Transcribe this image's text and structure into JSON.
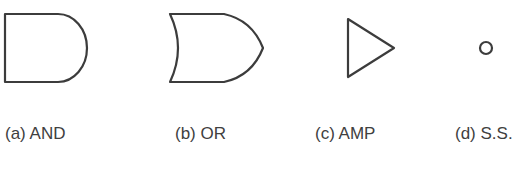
{
  "figure": {
    "symbols": [
      {
        "id": "a",
        "label": "(a) AND",
        "shape": "and-gate-icon"
      },
      {
        "id": "b",
        "label": "(b) OR",
        "shape": "or-gate-icon"
      },
      {
        "id": "c",
        "label": "(c) AMP",
        "shape": "amplifier-triangle-icon"
      },
      {
        "id": "d",
        "label": "(d) S.S.",
        "shape": "small-circle-icon"
      }
    ],
    "stroke_color": "#3c3c3c",
    "background": "#ffffff"
  }
}
